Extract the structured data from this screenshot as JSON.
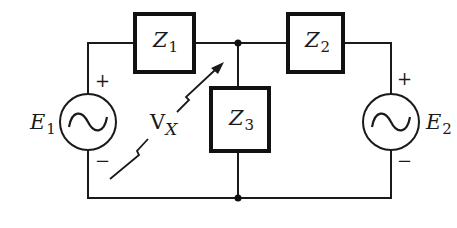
{
  "diagram": {
    "type": "circuit",
    "components": {
      "z1": {
        "symbol": "Z",
        "subscript": "1",
        "kind": "impedance"
      },
      "z2": {
        "symbol": "Z",
        "subscript": "2",
        "kind": "impedance"
      },
      "z3": {
        "symbol": "Z",
        "subscript": "3",
        "kind": "impedance"
      },
      "e1": {
        "symbol": "E",
        "subscript": "1",
        "kind": "ac-voltage-source",
        "plus": "+",
        "minus": "−"
      },
      "e2": {
        "symbol": "E",
        "subscript": "2",
        "kind": "ac-voltage-source",
        "plus": "+",
        "minus": "−"
      }
    },
    "voltage_label": {
      "symbol": "V",
      "subscript": "X"
    },
    "nodes": [
      "top-junction",
      "bottom-junction"
    ],
    "colors": {
      "line": "#1a1a1a",
      "background": "#ffffff"
    }
  }
}
